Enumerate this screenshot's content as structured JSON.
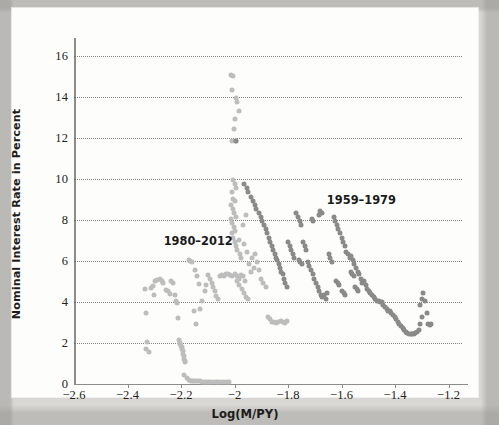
{
  "figure": {
    "background_color": "#d9d7d3",
    "card_color": "#fdfdfc"
  },
  "chart_data": {
    "type": "scatter",
    "title": "",
    "xlabel": "Log(M/PY)",
    "ylabel": "Nominal Interest Rate in Percent",
    "xlim": [
      -2.6,
      -1.15
    ],
    "ylim": [
      0,
      16.6
    ],
    "xticks": [
      -2.6,
      -2.4,
      -2.2,
      -2.0,
      -1.8,
      -1.6,
      -1.4,
      -1.2
    ],
    "xtick_labels": [
      "−2.6",
      "−2.4",
      "−2.2",
      "−2",
      "−1.8",
      "−1.6",
      "−1.4",
      "−1.2"
    ],
    "yticks": [
      0,
      2,
      4,
      6,
      8,
      10,
      12,
      14,
      16
    ],
    "ytick_labels": [
      "0",
      "2",
      "4",
      "6",
      "8",
      "10",
      "12",
      "14",
      "16"
    ],
    "grid": "horizontal-dotted",
    "grid_color": "#6f6f6f",
    "legend": "inline-annotations",
    "annotations": [
      {
        "text": "1980–2012",
        "x": -2.265,
        "y": 6.95,
        "name": "series-label-1980-2012"
      },
      {
        "text": "1959–1979",
        "x": -1.655,
        "y": 8.95,
        "name": "series-label-1959-1979"
      }
    ],
    "series": [
      {
        "name": "1980–2012",
        "color": "#bdbdbd",
        "marker": "circle",
        "marker_size": 5,
        "points": [
          [
            -2.335,
            4.65
          ],
          [
            -2.33,
            3.45
          ],
          [
            -2.327,
            2.05
          ],
          [
            -2.332,
            1.7
          ],
          [
            -2.318,
            1.55
          ],
          [
            -2.312,
            4.7
          ],
          [
            -2.305,
            4.8
          ],
          [
            -2.3,
            4.35
          ],
          [
            -2.296,
            5.05
          ],
          [
            -2.288,
            5.1
          ],
          [
            -2.28,
            5.15
          ],
          [
            -2.272,
            5.05
          ],
          [
            -2.266,
            4.95
          ],
          [
            -2.258,
            4.6
          ],
          [
            -2.25,
            4.55
          ],
          [
            -2.243,
            4.4
          ],
          [
            -2.236,
            5.05
          ],
          [
            -2.23,
            4.95
          ],
          [
            -2.222,
            4.35
          ],
          [
            -2.218,
            4.05
          ],
          [
            -2.215,
            3.95
          ],
          [
            -2.212,
            3.2
          ],
          [
            -2.208,
            2.15
          ],
          [
            -2.205,
            2.0
          ],
          [
            -2.202,
            1.95
          ],
          [
            -2.2,
            1.85
          ],
          [
            -2.198,
            1.8
          ],
          [
            -2.196,
            1.7
          ],
          [
            -2.194,
            1.6
          ],
          [
            -2.192,
            1.45
          ],
          [
            -2.19,
            1.35
          ],
          [
            -2.188,
            1.2
          ],
          [
            -2.186,
            1.1
          ],
          [
            -2.184,
            1.05
          ],
          [
            -2.19,
            0.45
          ],
          [
            -2.178,
            0.3
          ],
          [
            -2.17,
            0.18
          ],
          [
            -2.163,
            0.16
          ],
          [
            -2.156,
            0.15
          ],
          [
            -2.15,
            0.14
          ],
          [
            -2.143,
            0.14
          ],
          [
            -2.136,
            0.13
          ],
          [
            -2.13,
            0.13
          ],
          [
            -2.122,
            0.12
          ],
          [
            -2.115,
            0.12
          ],
          [
            -2.106,
            0.12
          ],
          [
            -2.098,
            0.12
          ],
          [
            -2.09,
            0.11
          ],
          [
            -2.08,
            0.11
          ],
          [
            -2.07,
            0.11
          ],
          [
            -2.06,
            0.1
          ],
          [
            -2.05,
            0.1
          ],
          [
            -2.04,
            0.1
          ],
          [
            -2.03,
            0.1
          ],
          [
            -2.02,
            0.1
          ],
          [
            -2.172,
            6.05
          ],
          [
            -2.165,
            6.02
          ],
          [
            -2.158,
            5.95
          ],
          [
            -2.148,
            5.55
          ],
          [
            -2.14,
            5.25
          ],
          [
            -2.132,
            4.9
          ],
          [
            -2.152,
            3.55
          ],
          [
            -2.144,
            2.95
          ],
          [
            -2.128,
            3.65
          ],
          [
            -2.12,
            4.05
          ],
          [
            -2.112,
            4.55
          ],
          [
            -2.105,
            4.85
          ],
          [
            -2.098,
            5.3
          ],
          [
            -2.092,
            5.15
          ],
          [
            -2.086,
            4.95
          ],
          [
            -2.08,
            4.75
          ],
          [
            -2.074,
            4.55
          ],
          [
            -2.068,
            4.3
          ],
          [
            -2.062,
            4.15
          ],
          [
            -2.056,
            5.25
          ],
          [
            -2.048,
            5.3
          ],
          [
            -2.04,
            5.25
          ],
          [
            -2.032,
            5.35
          ],
          [
            -2.024,
            5.35
          ],
          [
            -2.016,
            5.3
          ],
          [
            -2.008,
            5.25
          ],
          [
            -2.0,
            5.35
          ],
          [
            -1.992,
            5.25
          ],
          [
            -1.984,
            5.15
          ],
          [
            -1.976,
            5.3
          ],
          [
            -1.968,
            5.25
          ],
          [
            -1.96,
            5.05
          ],
          [
            -2.012,
            15.1
          ],
          [
            -2.004,
            15.05
          ],
          [
            -2.008,
            14.35
          ],
          [
            -1.996,
            13.95
          ],
          [
            -1.99,
            13.75
          ],
          [
            -1.985,
            13.35
          ],
          [
            -1.998,
            12.95
          ],
          [
            -2.002,
            12.45
          ],
          [
            -2.01,
            11.85
          ],
          [
            -1.994,
            11.85
          ],
          [
            -2.006,
            9.95
          ],
          [
            -2.0,
            9.75
          ],
          [
            -1.994,
            9.55
          ],
          [
            -2.01,
            9.35
          ],
          [
            -2.004,
            9.05
          ],
          [
            -1.998,
            8.95
          ],
          [
            -2.012,
            8.75
          ],
          [
            -2.006,
            8.55
          ],
          [
            -2.001,
            8.35
          ],
          [
            -1.996,
            8.15
          ],
          [
            -2.014,
            8.05
          ],
          [
            -2.008,
            7.85
          ],
          [
            -2.002,
            7.65
          ],
          [
            -1.998,
            7.45
          ],
          [
            -2.01,
            7.35
          ],
          [
            -2.005,
            7.15
          ],
          [
            -2.0,
            6.95
          ],
          [
            -1.995,
            6.75
          ],
          [
            -1.99,
            6.55
          ],
          [
            -1.985,
            7.05
          ],
          [
            -1.98,
            6.35
          ],
          [
            -1.975,
            6.15
          ],
          [
            -1.97,
            7.75
          ],
          [
            -1.965,
            6.85
          ],
          [
            -1.958,
            8.25
          ],
          [
            -1.952,
            6.45
          ],
          [
            -1.946,
            5.85
          ],
          [
            -1.94,
            5.45
          ],
          [
            -1.934,
            6.15
          ],
          [
            -1.928,
            5.65
          ],
          [
            -1.922,
            6.35
          ],
          [
            -1.916,
            5.95
          ],
          [
            -1.908,
            5.55
          ],
          [
            -1.9,
            5.15
          ],
          [
            -1.892,
            4.95
          ],
          [
            -1.884,
            4.75
          ],
          [
            -1.876,
            3.25
          ],
          [
            -1.868,
            3.15
          ],
          [
            -1.86,
            3.05
          ],
          [
            -1.852,
            3.05
          ],
          [
            -1.844,
            3.0
          ],
          [
            -1.836,
            3.05
          ],
          [
            -1.828,
            3.1
          ],
          [
            -1.82,
            3.05
          ],
          [
            -1.812,
            3.0
          ],
          [
            -1.804,
            3.1
          ],
          [
            -1.99,
            5.05
          ],
          [
            -1.982,
            4.85
          ],
          [
            -1.974,
            4.65
          ],
          [
            -1.966,
            4.45
          ],
          [
            -1.958,
            4.25
          ],
          [
            -1.95,
            4.15
          ]
        ]
      },
      {
        "name": "1959–1979",
        "color": "#8a8a8a",
        "marker": "circle",
        "marker_size": 5,
        "points": [
          [
            -1.995,
            11.85
          ],
          [
            -1.965,
            9.75
          ],
          [
            -1.955,
            9.55
          ],
          [
            -1.948,
            9.35
          ],
          [
            -1.94,
            9.15
          ],
          [
            -1.932,
            8.95
          ],
          [
            -1.925,
            8.75
          ],
          [
            -1.918,
            8.55
          ],
          [
            -1.91,
            8.35
          ],
          [
            -1.903,
            8.15
          ],
          [
            -1.896,
            7.95
          ],
          [
            -1.89,
            7.75
          ],
          [
            -1.884,
            7.55
          ],
          [
            -1.878,
            7.35
          ],
          [
            -1.872,
            7.15
          ],
          [
            -1.866,
            6.95
          ],
          [
            -1.86,
            6.75
          ],
          [
            -1.855,
            6.55
          ],
          [
            -1.85,
            6.35
          ],
          [
            -1.845,
            6.15
          ],
          [
            -1.84,
            6.05
          ],
          [
            -1.835,
            5.85
          ],
          [
            -1.83,
            5.65
          ],
          [
            -1.825,
            5.45
          ],
          [
            -1.82,
            5.35
          ],
          [
            -1.815,
            5.15
          ],
          [
            -1.81,
            4.95
          ],
          [
            -1.805,
            4.75
          ],
          [
            -1.8,
            6.95
          ],
          [
            -1.794,
            6.75
          ],
          [
            -1.788,
            6.55
          ],
          [
            -1.782,
            6.35
          ],
          [
            -1.776,
            6.15
          ],
          [
            -1.77,
            8.35
          ],
          [
            -1.763,
            8.15
          ],
          [
            -1.757,
            7.95
          ],
          [
            -1.75,
            7.75
          ],
          [
            -1.744,
            6.95
          ],
          [
            -1.738,
            6.75
          ],
          [
            -1.732,
            6.55
          ],
          [
            -1.726,
            5.95
          ],
          [
            -1.72,
            5.75
          ],
          [
            -1.714,
            5.55
          ],
          [
            -1.708,
            5.35
          ],
          [
            -1.702,
            5.15
          ],
          [
            -1.696,
            4.95
          ],
          [
            -1.69,
            4.75
          ],
          [
            -1.684,
            4.55
          ],
          [
            -1.678,
            4.35
          ],
          [
            -1.672,
            4.25
          ],
          [
            -1.666,
            4.35
          ],
          [
            -1.66,
            4.15
          ],
          [
            -1.654,
            4.45
          ],
          [
            -1.648,
            6.35
          ],
          [
            -1.642,
            6.15
          ],
          [
            -1.636,
            5.95
          ],
          [
            -1.63,
            8.15
          ],
          [
            -1.624,
            7.95
          ],
          [
            -1.618,
            7.75
          ],
          [
            -1.612,
            7.55
          ],
          [
            -1.606,
            7.35
          ],
          [
            -1.6,
            7.15
          ],
          [
            -1.594,
            6.95
          ],
          [
            -1.588,
            6.75
          ],
          [
            -1.582,
            6.45
          ],
          [
            -1.576,
            6.35
          ],
          [
            -1.57,
            6.15
          ],
          [
            -1.564,
            6.25
          ],
          [
            -1.558,
            6.05
          ],
          [
            -1.552,
            5.85
          ],
          [
            -1.546,
            5.65
          ],
          [
            -1.54,
            5.45
          ],
          [
            -1.534,
            5.35
          ],
          [
            -1.528,
            5.15
          ],
          [
            -1.522,
            4.95
          ],
          [
            -1.516,
            5.05
          ],
          [
            -1.51,
            4.85
          ],
          [
            -1.504,
            4.65
          ],
          [
            -1.498,
            4.55
          ],
          [
            -1.492,
            4.45
          ],
          [
            -1.486,
            4.35
          ],
          [
            -1.48,
            4.25
          ],
          [
            -1.474,
            4.15
          ],
          [
            -1.468,
            4.05
          ],
          [
            -1.462,
            4.05
          ],
          [
            -1.456,
            4.0
          ],
          [
            -1.45,
            4.0
          ],
          [
            -1.444,
            3.85
          ],
          [
            -1.438,
            3.75
          ],
          [
            -1.432,
            3.65
          ],
          [
            -1.426,
            3.55
          ],
          [
            -1.42,
            3.55
          ],
          [
            -1.414,
            3.45
          ],
          [
            -1.408,
            3.35
          ],
          [
            -1.402,
            3.25
          ],
          [
            -1.396,
            3.15
          ],
          [
            -1.39,
            3.05
          ],
          [
            -1.384,
            2.95
          ],
          [
            -1.378,
            2.85
          ],
          [
            -1.372,
            2.75
          ],
          [
            -1.366,
            2.65
          ],
          [
            -1.36,
            2.55
          ],
          [
            -1.354,
            2.5
          ],
          [
            -1.348,
            2.45
          ],
          [
            -1.342,
            2.45
          ],
          [
            -1.336,
            2.45
          ],
          [
            -1.33,
            2.45
          ],
          [
            -1.324,
            2.5
          ],
          [
            -1.318,
            2.55
          ],
          [
            -1.312,
            2.65
          ],
          [
            -1.306,
            2.95
          ],
          [
            -1.3,
            3.25
          ],
          [
            -1.294,
            4.45
          ],
          [
            -1.288,
            4.05
          ],
          [
            -1.282,
            3.45
          ],
          [
            -1.276,
            2.95
          ],
          [
            -1.27,
            2.9
          ],
          [
            -1.264,
            2.95
          ],
          [
            -1.306,
            3.85
          ],
          [
            -1.3,
            4.15
          ],
          [
            -1.68,
            8.45
          ],
          [
            -1.672,
            8.35
          ],
          [
            -1.686,
            8.25
          ],
          [
            -1.712,
            8.05
          ],
          [
            -1.706,
            7.95
          ],
          [
            -1.76,
            6.05
          ],
          [
            -1.754,
            5.95
          ],
          [
            -1.748,
            5.85
          ],
          [
            -1.598,
            4.55
          ],
          [
            -1.592,
            4.45
          ],
          [
            -1.586,
            4.35
          ],
          [
            -1.55,
            4.75
          ],
          [
            -1.544,
            4.65
          ],
          [
            -1.538,
            4.55
          ],
          [
            -1.62,
            5.05
          ],
          [
            -1.614,
            4.95
          ],
          [
            -1.608,
            4.85
          ],
          [
            -1.566,
            5.45
          ],
          [
            -1.56,
            5.35
          ],
          [
            -1.554,
            5.25
          ]
        ]
      }
    ]
  }
}
